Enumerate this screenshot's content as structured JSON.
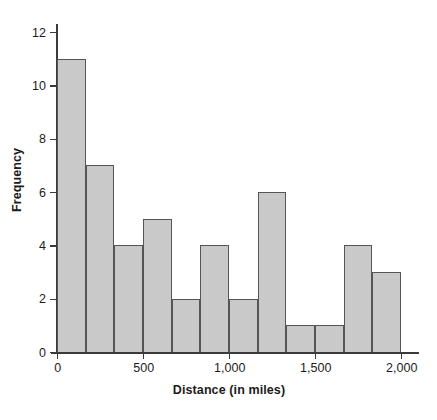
{
  "chart_data": {
    "type": "bar",
    "title": "",
    "subtitle": "",
    "xlabel": "Distance (in miles)",
    "ylabel": "Frequency",
    "xlim": [
      0,
      2000
    ],
    "ylim": [
      0,
      12
    ],
    "grid": false,
    "legend": null,
    "bin_width": 166.67,
    "bin_edges": [
      0,
      166.67,
      333.33,
      500,
      666.67,
      833.33,
      1000,
      1166.67,
      1333.33,
      1500,
      1666.67,
      1833.33,
      2000
    ],
    "categories": [
      "0-167",
      "167-333",
      "333-500",
      "500-667",
      "667-833",
      "833-1000",
      "1000-1167",
      "1167-1333",
      "1333-1500",
      "1500-1667",
      "1667-1833",
      "1833-2000"
    ],
    "values": [
      11,
      7,
      4,
      5,
      2,
      4,
      2,
      6,
      1,
      1,
      4,
      3
    ],
    "x_ticks": [
      {
        "value": 0,
        "label": "0"
      },
      {
        "value": 500,
        "label": "500"
      },
      {
        "value": 1000,
        "label": "1,000"
      },
      {
        "value": 1500,
        "label": "1,500"
      },
      {
        "value": 2000,
        "label": "2,000"
      }
    ],
    "y_ticks": [
      {
        "value": 0,
        "label": "0"
      },
      {
        "value": 2,
        "label": "2"
      },
      {
        "value": 4,
        "label": "4"
      },
      {
        "value": 6,
        "label": "6"
      },
      {
        "value": 8,
        "label": "8"
      },
      {
        "value": 10,
        "label": "10"
      },
      {
        "value": 12,
        "label": "12"
      }
    ],
    "colors": {
      "bar_fill": "#c9c9c9",
      "bar_stroke": "#555555",
      "axis": "#3b3b3b",
      "text": "#1c1c1c",
      "background": "#ffffff"
    }
  }
}
